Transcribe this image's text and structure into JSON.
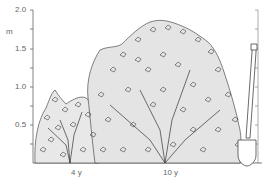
{
  "figure": {
    "y_axis": {
      "unit": "m",
      "ticks": [
        "2.0",
        "1.5",
        "1.0",
        "0.5"
      ],
      "range": [
        0,
        2.0
      ]
    },
    "x_labels": [
      "4 y",
      "10 y"
    ],
    "subjects": [
      {
        "name": "shrub at 4 years",
        "approx_height_m": 0.95
      },
      {
        "name": "shrub at 10 years",
        "approx_height_m": 1.6
      },
      {
        "name": "spade for scale",
        "approx_height_m": 1.5
      }
    ],
    "colors": {
      "line": "#555555",
      "foliage": "#222222"
    }
  }
}
